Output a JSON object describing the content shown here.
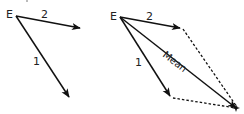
{
  "diagrams": {
    "left": {
      "origin_label": "E",
      "vectors": [
        {
          "label": "2",
          "role": "vector-2"
        },
        {
          "label": "1",
          "role": "vector-1"
        }
      ]
    },
    "right": {
      "origin_label": "E",
      "vectors": [
        {
          "label": "2",
          "role": "vector-2"
        },
        {
          "label": "1",
          "role": "vector-1"
        },
        {
          "label": "Mean",
          "role": "resultant-mean"
        }
      ],
      "construction": "parallelogram (dashed sides)"
    }
  },
  "colors": {
    "stroke": "#111111",
    "text": "#222222",
    "background": "#ffffff"
  }
}
